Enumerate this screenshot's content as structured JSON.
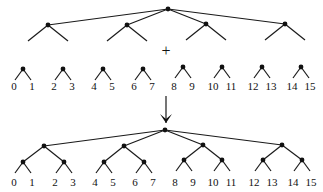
{
  "diagram": {
    "title": "",
    "plus_symbol": "+",
    "top_tree": {
      "root": [
        168,
        9
      ],
      "children": [
        [
          48,
          25
        ],
        [
          127,
          25
        ],
        [
          206,
          24
        ],
        [
          285,
          24
        ]
      ],
      "stub_dx": 20,
      "stub_dy": 16
    },
    "small_trees": {
      "nodes": [
        [
          23,
          69
        ],
        [
          63,
          69
        ],
        [
          103,
          69
        ],
        [
          143,
          69
        ],
        [
          183,
          67
        ],
        [
          222,
          67
        ],
        [
          262,
          67
        ],
        [
          301,
          67
        ]
      ],
      "leaf_dx": 8,
      "leaf_dy": 11,
      "labels": [
        [
          "0",
          "1"
        ],
        [
          "2",
          "3"
        ],
        [
          "4",
          "5"
        ],
        [
          "6",
          "7"
        ],
        [
          "8",
          "9"
        ],
        [
          "10",
          "11"
        ],
        [
          "12",
          "13"
        ],
        [
          "14",
          "15"
        ]
      ],
      "label_y": 90
    },
    "arrow": {
      "x": 166,
      "y1": 96,
      "y2": 123
    },
    "bottom_tree": {
      "root": [
        165,
        130
      ],
      "level1": [
        [
          44,
          146
        ],
        [
          124,
          146
        ],
        [
          203,
          145
        ],
        [
          282,
          145
        ]
      ],
      "level2": [
        [
          23,
          162
        ],
        [
          64,
          162
        ],
        [
          104,
          162
        ],
        [
          144,
          162
        ],
        [
          184,
          160
        ],
        [
          222,
          160
        ],
        [
          263,
          160
        ],
        [
          302,
          160
        ]
      ],
      "leaf_dx": 8,
      "leaf_dy": 11,
      "labels": [
        [
          "0",
          "1"
        ],
        [
          "2",
          "3"
        ],
        [
          "4",
          "5"
        ],
        [
          "6",
          "7"
        ],
        [
          "8",
          "9"
        ],
        [
          "10",
          "11"
        ],
        [
          "12",
          "13"
        ],
        [
          "14",
          "15"
        ]
      ],
      "label_y": 186
    }
  }
}
